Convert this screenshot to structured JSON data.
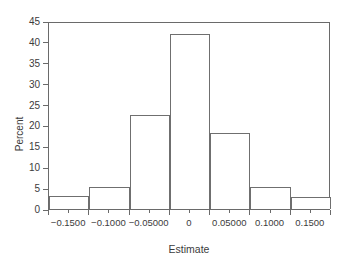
{
  "chart_data": {
    "type": "bar",
    "title": "",
    "subtitle": "",
    "xlabel": "Estimate",
    "ylabel": "Percent",
    "xlim": [
      -0.175,
      0.175
    ],
    "ylim": [
      0,
      45
    ],
    "grid": false,
    "legend": null,
    "bin_width": 0.05,
    "categories": [
      "-0.1500",
      "-0.1000",
      "-0.05000",
      "0",
      "0.05000",
      "0.1000",
      "0.1500"
    ],
    "bin_centers": [
      -0.15,
      -0.1,
      -0.05,
      0,
      0.05,
      0.1,
      0.15
    ],
    "bin_edges": [
      -0.175,
      -0.125,
      -0.075,
      -0.025,
      0.025,
      0.075,
      0.125,
      0.175
    ],
    "values": [
      3.0,
      5.2,
      22.4,
      42.0,
      18.1,
      5.2,
      2.9
    ],
    "x_tick_labels": [
      "-0.1500",
      "-0.1000",
      "-0.05000",
      "0",
      "0.05000",
      "0.1000",
      "0.1500"
    ],
    "y_tick_labels": [
      "0",
      "5",
      "10",
      "15",
      "20",
      "25",
      "30",
      "35",
      "40",
      "45"
    ],
    "y_ticks": [
      0,
      5,
      10,
      15,
      20,
      25,
      30,
      35,
      40,
      45
    ],
    "colors": {
      "bar_fill": "#ffffff",
      "bar_stroke": "#6f6f6f",
      "axis": "#6a6a6a",
      "text": "#3c3c3c",
      "background": "#ffffff"
    }
  }
}
